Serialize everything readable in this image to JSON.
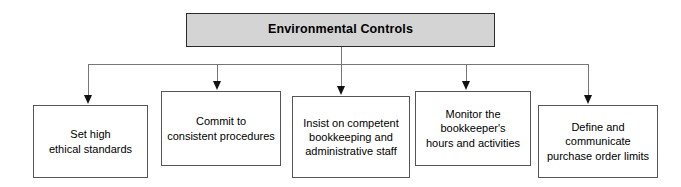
{
  "diagram": {
    "title": "Environmental Controls",
    "type": "organizational-tree",
    "root": {
      "label": "Environmental Controls",
      "fill_color": "#d4d4d4",
      "border_color": "#2b2b2b"
    },
    "connector_color": "#777777",
    "arrow_color": "#111111",
    "node_fill_color": "#ffffff",
    "node_border_color": "#555555",
    "nodes": [
      {
        "label": "Set high\nethical standards"
      },
      {
        "label": "Commit to\nconsistent procedures"
      },
      {
        "label": "Insist on competent\nbookkeeping and\nadministrative staff"
      },
      {
        "label": "Monitor the\nbookkeeper's\nhours and activities"
      },
      {
        "label": "Define and\ncommunicate\npurchase order limits"
      }
    ]
  }
}
